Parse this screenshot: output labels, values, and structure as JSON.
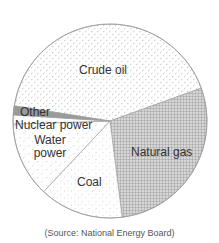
{
  "chart_data": {
    "type": "pie",
    "title": "",
    "categories": [
      "Crude oil",
      "Natural gas",
      "Coal",
      "Water power",
      "Nuclear power",
      "Other"
    ],
    "values": [
      42,
      28.5,
      14,
      12.5,
      1.5,
      1.5
    ],
    "unit": "%",
    "start_angle_deg_clockwise_from_top": 279,
    "direction": "clockwise",
    "legend": "none (labels inside slices)",
    "patterns": {
      "Crude oil": "sparse dots",
      "Natural gas": "cross-hatch grid",
      "Coal": "fine speckle",
      "Water power": "light dashes",
      "Nuclear power": "light dashes",
      "Other": "solid gray"
    },
    "source": "(Source: National Energy Board)"
  },
  "labels": {
    "crude_oil": "Crude oil",
    "natural_gas": "Natural gas",
    "coal": "Coal",
    "water_power_line1": "Water",
    "water_power_line2": "power",
    "nuclear_power": "Nuclear power",
    "other": "Other"
  },
  "source": "(Source: National Energy Board)",
  "colors": {
    "outline": "#999999",
    "other_fill": "#9a9a9a",
    "grid": "#8c8c8c",
    "dots": "#b0b0b0",
    "text": "#333333"
  }
}
